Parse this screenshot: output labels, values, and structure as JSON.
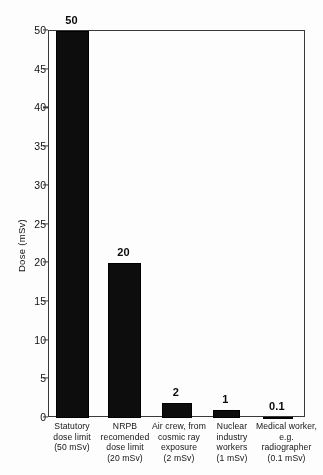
{
  "chart_data": {
    "type": "bar",
    "title": "",
    "xlabel": "",
    "ylabel": "Dose (mSv)",
    "ylim": [
      0,
      50
    ],
    "yticks": [
      0,
      5,
      10,
      15,
      20,
      25,
      30,
      35,
      40,
      45,
      50
    ],
    "grid": false,
    "legend": "none",
    "bar_color": "#0d0d0d",
    "categories": [
      "Statutory dose limit (50 mSv)",
      "NRPB recomended dose limit (20 mSv)",
      "Air crew, from cosmic ray exposure (2 mSv)",
      "Nuclear industry workers (1 mSv)",
      "Medical worker, e.g. radiographer (0.1 mSv)"
    ],
    "category_lines": [
      [
        "Statutory",
        "dose limit",
        "(50 mSv)"
      ],
      [
        "NRPB",
        "recomended",
        "dose limit",
        "(20 mSv)"
      ],
      [
        "Air crew, from",
        "cosmic ray",
        "exposure",
        "(2 mSv)"
      ],
      [
        "Nuclear",
        "industry",
        "workers",
        "(1 mSv)"
      ],
      [
        "Medical worker,",
        "e.g.",
        "radiographer",
        "(0.1 mSv)"
      ]
    ],
    "values": [
      50,
      20,
      2,
      1,
      0.1
    ],
    "value_labels": [
      "50",
      "20",
      "2",
      "1",
      "0.1"
    ]
  }
}
